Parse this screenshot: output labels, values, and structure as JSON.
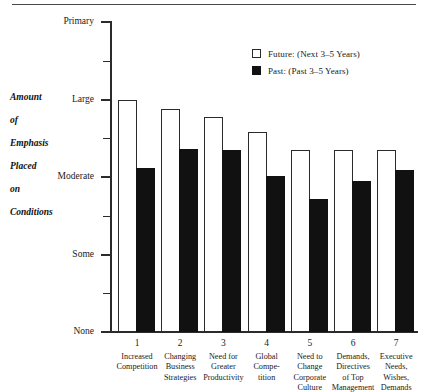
{
  "figure": {
    "y_axis_title_lines": [
      "Amount",
      "of",
      "Emphasis",
      "Placed",
      "on",
      "Conditions"
    ]
  },
  "legend": {
    "position": "top-right",
    "items": [
      {
        "key": "future",
        "swatch": "open-square-swatch",
        "label": "Future: (Next 3–5 Years)",
        "color": "#ffffff"
      },
      {
        "key": "past",
        "swatch": "filled-square-swatch",
        "label": "Past: (Past 3–5 Years)",
        "color": "#111111"
      }
    ]
  },
  "chart_data": {
    "type": "bar",
    "title": "",
    "subtitle": "",
    "xlabel": "",
    "ylabel": "Amount of Emphasis Placed on Conditions",
    "grid": false,
    "legend_position": "top-right",
    "ylim": [
      0,
      4
    ],
    "ytick_values": [
      0,
      1,
      2,
      3,
      4
    ],
    "ytick_labels": [
      "None",
      "Some",
      "Moderate",
      "Large",
      "Primary"
    ],
    "yminor_tick_values": [
      0.5,
      1.5,
      2.5,
      3.5
    ],
    "categories": [
      "1",
      "2",
      "3",
      "4",
      "5",
      "6",
      "7"
    ],
    "category_labels": [
      "Increased\nCompetition",
      "Changing\nBusiness\nStrategies",
      "Need for\nGreater\nProductivity",
      "Global\nCompe-\ntition",
      "Need to\nChange\nCorporate\nCulture",
      "Demands,\nDirectives\nof Top\nManagement",
      "Executive\nNeeds,\nWishes,\nDemands"
    ],
    "series": [
      {
        "name": "Future: (Next 3–5 Years)",
        "color": "#ffffff",
        "values": [
          3.0,
          2.88,
          2.77,
          2.58,
          2.35,
          2.35,
          2.35
        ]
      },
      {
        "name": "Past: (Past 3–5 Years)",
        "color": "#111111",
        "values": [
          2.12,
          2.36,
          2.35,
          2.01,
          1.72,
          1.95,
          2.09
        ]
      }
    ]
  }
}
